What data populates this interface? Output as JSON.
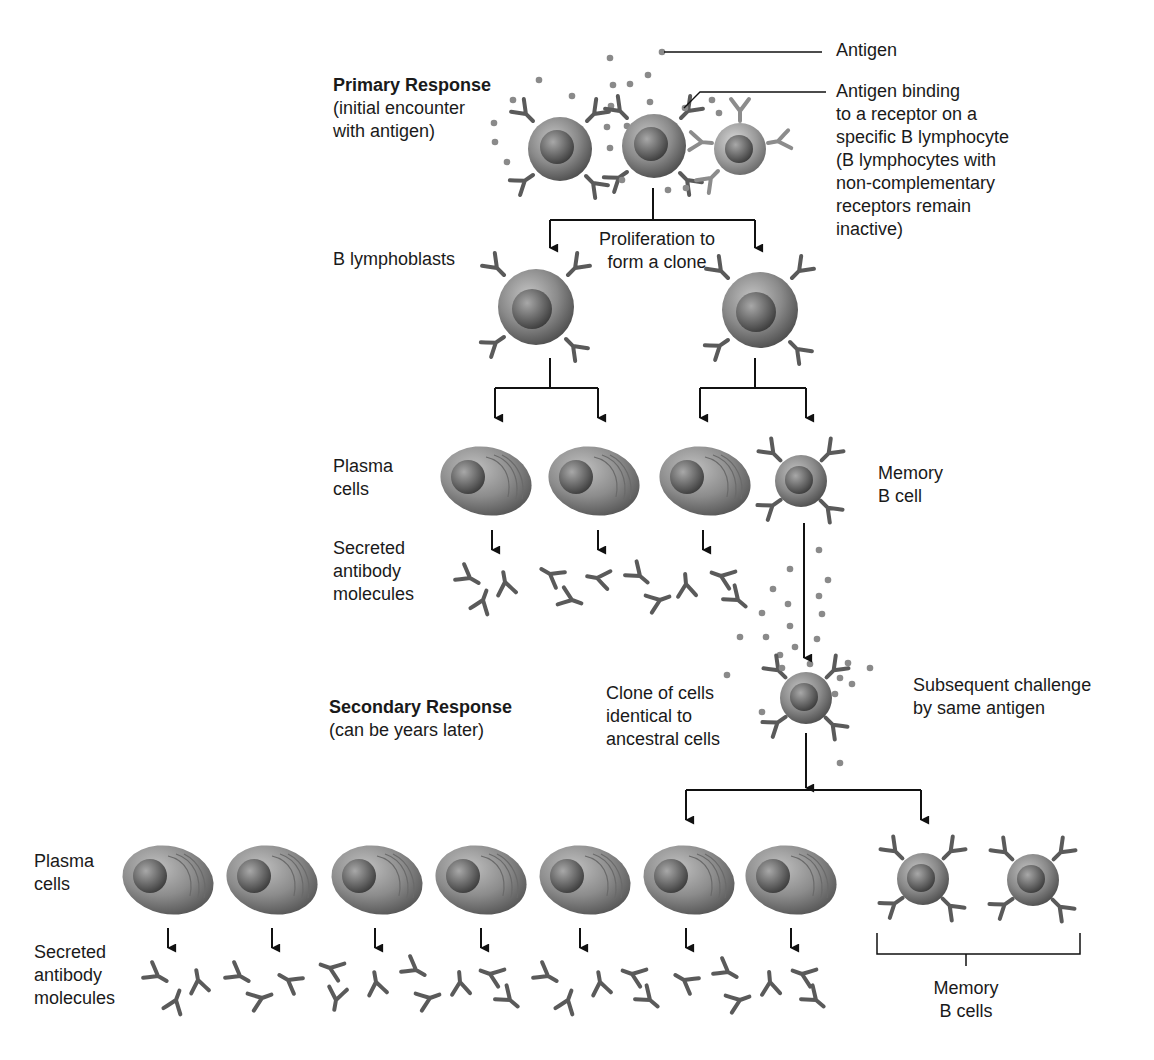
{
  "diagram": {
    "type": "flow",
    "colors": {
      "line": "#111111",
      "cell_dark": "#4a4a4a",
      "cell_light": "#bdbdbd",
      "antigen": "#8a8a8a",
      "receptor": "#5a5a5a"
    },
    "primary": {
      "title": "Primary Response",
      "subtitle": "(initial encounter\nwith antigen)"
    },
    "callouts": {
      "antigen": "Antigen",
      "binding": "Antigen binding\nto a receptor on a\nspecific B lymphocyte\n(B lymphocytes with\nnon-complementary\nreceptors remain\ninactive)"
    },
    "labels": {
      "lymphoblasts": "B lymphoblasts",
      "proliferation": "Proliferation to\nform a clone",
      "plasma_cells_1": "Plasma\ncells",
      "memory_cell_1": "Memory\nB cell",
      "secreted_1": "Secreted\nantibody\nmolecules",
      "clone_identical": "Clone of cells\nidentical to\nancestral cells",
      "subsequent": "Subsequent challenge\nby same antigen",
      "plasma_cells_2": "Plasma\ncells",
      "secreted_2": "Secreted\nantibody\nmolecules",
      "memory_cells_2": "Memory\nB cells"
    },
    "secondary": {
      "title": "Secondary Response",
      "subtitle": "(can be years later)"
    },
    "nodes": [
      {
        "id": "b-lymphocytes-initial",
        "count": 3,
        "note": "middle cell binds antigen"
      },
      {
        "id": "b-lymphoblasts",
        "count": 2
      },
      {
        "id": "plasma-cells-primary",
        "count": 3
      },
      {
        "id": "memory-b-cell-primary",
        "count": 1
      },
      {
        "id": "memory-b-cell-challenged",
        "count": 1
      },
      {
        "id": "plasma-cells-secondary",
        "count": 7
      },
      {
        "id": "memory-b-cells-secondary",
        "count": 2
      }
    ],
    "edges": [
      {
        "from": "b-lymphocytes-initial",
        "to": "b-lymphoblasts"
      },
      {
        "from": "b-lymphoblasts",
        "to": "plasma-cells-primary"
      },
      {
        "from": "b-lymphoblasts",
        "to": "memory-b-cell-primary"
      },
      {
        "from": "memory-b-cell-primary",
        "to": "memory-b-cell-challenged"
      },
      {
        "from": "memory-b-cell-challenged",
        "to": "plasma-cells-secondary"
      },
      {
        "from": "memory-b-cell-challenged",
        "to": "memory-b-cells-secondary"
      }
    ]
  }
}
